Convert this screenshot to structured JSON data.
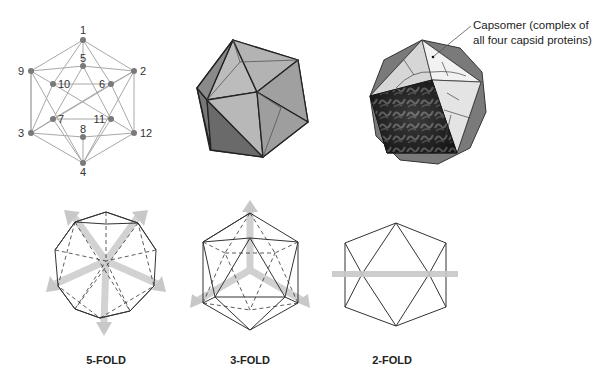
{
  "vertex_diagram": {
    "vertices": [
      {
        "id": "1",
        "x": 83,
        "y": 40,
        "lx": 83,
        "ly": 34,
        "anchor": "middle"
      },
      {
        "id": "2",
        "x": 134,
        "y": 71,
        "lx": 140,
        "ly": 75,
        "anchor": "start"
      },
      {
        "id": "3",
        "x": 31,
        "y": 133,
        "lx": 24,
        "ly": 137,
        "anchor": "end"
      },
      {
        "id": "4",
        "x": 83,
        "y": 163,
        "lx": 83,
        "ly": 176,
        "anchor": "middle"
      },
      {
        "id": "5",
        "x": 83,
        "y": 66,
        "lx": 83,
        "ly": 62,
        "anchor": "middle"
      },
      {
        "id": "6",
        "x": 111,
        "y": 84,
        "lx": 105,
        "ly": 88,
        "anchor": "end"
      },
      {
        "id": "7",
        "x": 53,
        "y": 119,
        "lx": 58,
        "ly": 123,
        "anchor": "start"
      },
      {
        "id": "8",
        "x": 83,
        "y": 137,
        "lx": 83,
        "ly": 133,
        "anchor": "middle"
      },
      {
        "id": "9",
        "x": 31,
        "y": 71,
        "lx": 24,
        "ly": 75,
        "anchor": "end"
      },
      {
        "id": "10",
        "x": 53,
        "y": 84,
        "lx": 58,
        "ly": 88,
        "anchor": "start"
      },
      {
        "id": "11",
        "x": 111,
        "y": 119,
        "lx": 105,
        "ly": 123,
        "anchor": "end"
      },
      {
        "id": "12",
        "x": 134,
        "y": 133,
        "lx": 140,
        "ly": 137,
        "anchor": "start"
      }
    ]
  },
  "capsomer_callout": {
    "line1": "Capsomer (complex of",
    "line2": "all four capsid proteins)"
  },
  "symmetry_labels": {
    "five_fold": "5-FOLD",
    "three_fold": "3-FOLD",
    "two_fold": "2-FOLD"
  },
  "colors": {
    "edge": "#9a9a9a",
    "vertex": "#7a7a7a",
    "arrow": "#cfcfcf",
    "face_dark": "#6e6e6e",
    "face_light": "#c9c9c9"
  }
}
